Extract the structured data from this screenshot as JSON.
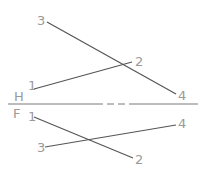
{
  "diagram": {
    "type": "descriptive-geometry-projection",
    "colors": {
      "line": "#555555",
      "label": "#9a9a9a",
      "fold": "#7a7a7a"
    },
    "planes": {
      "top_label": "H",
      "bottom_label": "F"
    },
    "fold_line": {
      "y": 104,
      "x1": 8,
      "x2": 198
    },
    "top_view": {
      "points": [
        {
          "label": "1",
          "x": 34,
          "y": 89,
          "lx": 28,
          "ly": 90
        },
        {
          "label": "2",
          "x": 132,
          "y": 62,
          "lx": 135,
          "ly": 66
        },
        {
          "label": "3",
          "x": 47,
          "y": 22,
          "lx": 37,
          "ly": 25
        },
        {
          "label": "4",
          "x": 176,
          "y": 94,
          "lx": 178,
          "ly": 100
        }
      ],
      "segments": [
        {
          "from": "1",
          "to": "2"
        },
        {
          "from": "3",
          "to": "4"
        }
      ]
    },
    "front_view": {
      "points": [
        {
          "label": "1",
          "x": 34,
          "y": 117,
          "lx": 28,
          "ly": 121
        },
        {
          "label": "2",
          "x": 133,
          "y": 158,
          "lx": 135,
          "ly": 164
        },
        {
          "label": "3",
          "x": 45,
          "y": 147,
          "lx": 37,
          "ly": 152
        },
        {
          "label": "4",
          "x": 176,
          "y": 125,
          "lx": 178,
          "ly": 128
        }
      ],
      "segments": [
        {
          "from": "1",
          "to": "2"
        },
        {
          "from": "3",
          "to": "4"
        }
      ]
    }
  }
}
